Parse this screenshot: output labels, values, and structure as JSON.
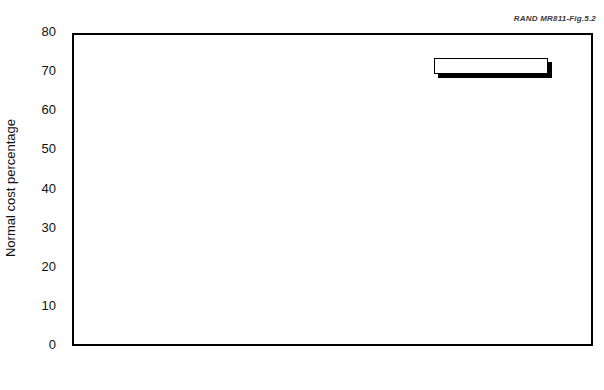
{
  "source_note": "RAND MR811-Fig.5.2",
  "legend": {
    "position": "top-right-inside",
    "entries": [
      {
        "label": "FP",
        "color": "#000000",
        "swatch": "fp"
      },
      {
        "label": "HI-3",
        "color": "#848484",
        "swatch": "hi3"
      },
      {
        "label": "REDUX",
        "color": "#c3c3c3",
        "swatch": "redux"
      }
    ]
  },
  "chart_data": {
    "type": "bar",
    "title": "",
    "subtitle": "",
    "xlabel": "",
    "ylabel": "Normal cost percentage",
    "categories": [
      "Officer",
      "Enlisted"
    ],
    "series": [
      {
        "name": "FP",
        "color": "#000000",
        "values": [
          66,
          42
        ]
      },
      {
        "name": "HI-3",
        "color": "#848484",
        "values": [
          58,
          36
        ]
      },
      {
        "name": "REDUX",
        "color": "#c3c3c3",
        "values": [
          51,
          30
        ]
      }
    ],
    "ylim": [
      0,
      80
    ],
    "yticks": [
      0,
      10,
      20,
      30,
      40,
      50,
      60,
      70,
      80
    ],
    "ytick_labels": [
      "0",
      "10",
      "20",
      "30",
      "40",
      "50",
      "60",
      "70",
      "80"
    ],
    "grid": false,
    "legend_entries": [
      "FP",
      "HI-3",
      "REDUX"
    ],
    "annotations": [
      "RAND MR811-Fig.5.2"
    ]
  }
}
